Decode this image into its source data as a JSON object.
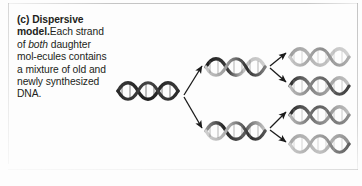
{
  "figure": {
    "panel_letter": "(c)",
    "title": "Dispersive model.",
    "title_bold_first": "Dispersive",
    "title_bold_second": "model.",
    "caption_text": "(c) Dispersive model. Each strand of both daughter molecules contains a mixture of old and newly synthesized DNA.",
    "caption_lines": [
      "(c) Dispersive",
      "model. Each",
      "strand of both",
      "daughter mol-",
      "ecules contains",
      "a mixture of",
      "old and newly",
      "synthesized",
      "DNA."
    ],
    "caption_segments": {
      "panel_letter": "(c)",
      "bold_word_1": "Dispersive",
      "bold_word_2": "model.",
      "plain_1": "Each strand of ",
      "italic_1": "both",
      "plain_2": " daughter mol-ecules contains a mixture of old and newly synthesized DNA."
    }
  },
  "colors": {
    "old_strand": "#2b2b2b",
    "new_strand": "#c9c9c9",
    "mixed_strand_mid": "#8a8a8a",
    "arrow": "#1a1a1a",
    "background": "#fdfdfd",
    "text": "#231f20",
    "border": "#9a9a9a"
  },
  "diagram": {
    "generations": [
      {
        "name": "parent-molecule",
        "label": "parent DNA molecule",
        "count": 1,
        "shading": "all-old",
        "helices": [
          {
            "id": "parent-helix",
            "x": 116,
            "y": 78,
            "width": 66,
            "height": 24,
            "dark_ratio": 1.0
          }
        ]
      },
      {
        "name": "first-generation",
        "label": "first generation daughter molecules",
        "count": 2,
        "shading": "half-old-half-new-dispersed",
        "helices": [
          {
            "id": "gen1-helix-top",
            "x": 204,
            "y": 54,
            "width": 62,
            "height": 24,
            "dark_ratio": 0.5
          },
          {
            "id": "gen1-helix-bottom",
            "x": 204,
            "y": 118,
            "width": 62,
            "height": 24,
            "dark_ratio": 0.5
          }
        ]
      },
      {
        "name": "second-generation",
        "label": "second generation daughter molecules",
        "count": 4,
        "shading": "quarter-old-dispersed",
        "helices": [
          {
            "id": "gen2-helix-1",
            "x": 288,
            "y": 44,
            "width": 62,
            "height": 24,
            "dark_ratio": 0.22
          },
          {
            "id": "gen2-helix-2",
            "x": 288,
            "y": 73,
            "width": 62,
            "height": 24,
            "dark_ratio": 0.35
          },
          {
            "id": "gen2-helix-3",
            "x": 288,
            "y": 102,
            "width": 62,
            "height": 24,
            "dark_ratio": 0.35
          },
          {
            "id": "gen2-helix-4",
            "x": 288,
            "y": 131,
            "width": 62,
            "height": 24,
            "dark_ratio": 0.22
          }
        ]
      }
    ],
    "arrows": [
      {
        "id": "arrow-parent-to-gen1-top",
        "x1": 184,
        "y1": 95,
        "x2": 202,
        "y2": 66,
        "from": "parent-helix",
        "to": "gen1-helix-top"
      },
      {
        "id": "arrow-parent-to-gen1-bottom",
        "x1": 184,
        "y1": 97,
        "x2": 202,
        "y2": 128,
        "from": "parent-helix",
        "to": "gen1-helix-bottom"
      },
      {
        "id": "arrow-gen1top-to-gen2-1",
        "x1": 268,
        "y1": 66,
        "x2": 285,
        "y2": 52,
        "from": "gen1-helix-top",
        "to": "gen2-helix-1"
      },
      {
        "id": "arrow-gen1top-to-gen2-2",
        "x1": 268,
        "y1": 68,
        "x2": 285,
        "y2": 83,
        "from": "gen1-helix-top",
        "to": "gen2-helix-2"
      },
      {
        "id": "arrow-gen1bottom-to-gen2-3",
        "x1": 268,
        "y1": 128,
        "x2": 285,
        "y2": 112,
        "from": "gen1-helix-bottom",
        "to": "gen2-helix-3"
      },
      {
        "id": "arrow-gen1bottom-to-gen2-4",
        "x1": 268,
        "y1": 130,
        "x2": 285,
        "y2": 143,
        "from": "gen1-helix-bottom",
        "to": "gen2-helix-4"
      }
    ]
  }
}
